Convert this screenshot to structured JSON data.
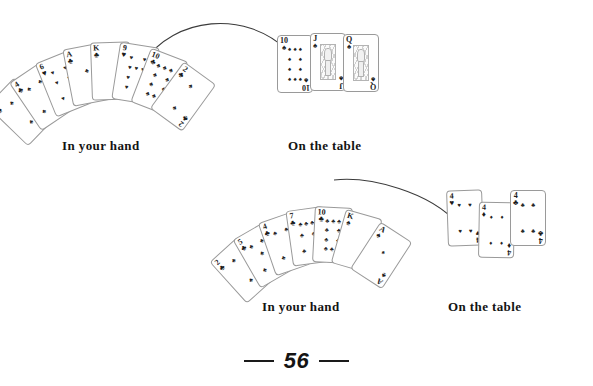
{
  "page": {
    "folio": "56",
    "background": "#ffffff",
    "ink": "#1a1a1a"
  },
  "captions": {
    "hand_1": "In your hand",
    "table_1": "On the table",
    "hand_2": "In your hand",
    "table_2": "On the table"
  },
  "examples": [
    {
      "id": "example-1",
      "hand": {
        "label": "In your hand",
        "cards": [
          {
            "rank": "2",
            "suit": "♣",
            "suit_name": "clubs",
            "color": "blk",
            "angle": -46,
            "x": 0,
            "y": 48
          },
          {
            "rank": "4",
            "suit": "♣",
            "suit_name": "clubs",
            "color": "blk",
            "angle": -34,
            "x": 16,
            "y": 36
          },
          {
            "rank": "6",
            "suit": "♥",
            "suit_name": "hearts",
            "color": "red",
            "angle": -22,
            "x": 33,
            "y": 26
          },
          {
            "rank": "A",
            "suit": "♣",
            "suit_name": "clubs",
            "color": "blk",
            "angle": -11,
            "x": 51,
            "y": 19
          },
          {
            "rank": "K",
            "suit": "♣",
            "suit_name": "clubs",
            "color": "blk",
            "angle": -2,
            "x": 70,
            "y": 16
          },
          {
            "rank": "9",
            "suit": "♥",
            "suit_name": "hearts",
            "color": "red",
            "angle": 9,
            "x": 89,
            "y": 18
          },
          {
            "rank": "10",
            "suit": "♣",
            "suit_name": "clubs",
            "color": "blk",
            "angle": 21,
            "x": 107,
            "y": 25
          },
          {
            "rank": "2",
            "suit": "♣",
            "suit_name": "clubs",
            "color": "blk",
            "angle": 36,
            "x": 124,
            "y": 36
          }
        ]
      },
      "table": {
        "label": "On the table",
        "cards": [
          {
            "rank": "10",
            "suit": "♠",
            "suit_name": "spades",
            "color": "blk",
            "face": false,
            "angle": 0,
            "x": 0,
            "y": 2
          },
          {
            "rank": "J",
            "suit": "♠",
            "suit_name": "spades",
            "color": "blk",
            "face": true,
            "angle": 0,
            "x": 33,
            "y": 0
          },
          {
            "rank": "Q",
            "suit": "♠",
            "suit_name": "spades",
            "color": "blk",
            "face": true,
            "angle": 0,
            "x": 66,
            "y": 1
          }
        ]
      },
      "arrow": {
        "from": "hand",
        "to": "table",
        "direction": "right"
      }
    },
    {
      "id": "example-2",
      "hand": {
        "label": "In your hand",
        "cards": [
          {
            "rank": "2",
            "suit": "♣",
            "suit_name": "clubs",
            "color": "blk",
            "angle": -42,
            "x": 0,
            "y": 45
          },
          {
            "rank": "5",
            "suit": "♣",
            "suit_name": "clubs",
            "color": "blk",
            "angle": -30,
            "x": 16,
            "y": 33
          },
          {
            "rank": "4",
            "suit": "♣",
            "suit_name": "clubs",
            "color": "blk",
            "angle": -19,
            "x": 33,
            "y": 24
          },
          {
            "rank": "7",
            "suit": "♣",
            "suit_name": "clubs",
            "color": "blk",
            "angle": -8,
            "x": 51,
            "y": 18
          },
          {
            "rank": "10",
            "suit": "♣",
            "suit_name": "clubs",
            "color": "blk",
            "angle": 3,
            "x": 70,
            "y": 17
          },
          {
            "rank": "K",
            "suit": "♠",
            "suit_name": "spades",
            "color": "blk",
            "angle": 16,
            "x": 88,
            "y": 22
          },
          {
            "rank": "A",
            "suit": "♠",
            "suit_name": "spades",
            "color": "blk",
            "angle": 33,
            "x": 105,
            "y": 33
          }
        ]
      },
      "table": {
        "label": "On the table",
        "cards": [
          {
            "rank": "4",
            "suit": "♥",
            "suit_name": "hearts",
            "color": "red",
            "face": false,
            "angle": -2,
            "x": 0,
            "y": 0
          },
          {
            "rank": "4",
            "suit": "♦",
            "suit_name": "diamonds",
            "color": "red",
            "face": false,
            "angle": 1,
            "x": 30,
            "y": 12
          },
          {
            "rank": "4",
            "suit": "♣",
            "suit_name": "clubs",
            "color": "blk",
            "face": false,
            "angle": 0,
            "x": 62,
            "y": 0
          }
        ]
      },
      "arrow": {
        "from": "hand",
        "to": "table",
        "direction": "right"
      }
    }
  ]
}
